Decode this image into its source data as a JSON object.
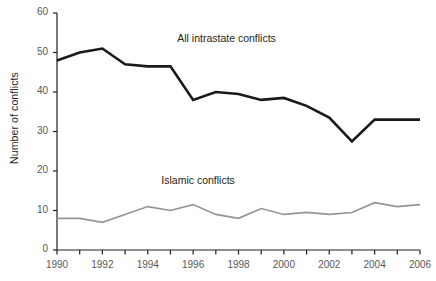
{
  "chart_data": {
    "type": "line",
    "title": "",
    "xlabel": "",
    "ylabel": "Number of conflicts",
    "xlim": [
      1990,
      2006
    ],
    "ylim": [
      0,
      60
    ],
    "grid": false,
    "legend_position": "inline-annotations",
    "x": [
      1990,
      1991,
      1992,
      1993,
      1994,
      1995,
      1996,
      1997,
      1998,
      1999,
      2000,
      2001,
      2002,
      2003,
      2004,
      2005,
      2006
    ],
    "xtick_labels": [
      "1990",
      "1992",
      "1994",
      "1996",
      "1998",
      "2000",
      "2002",
      "2004",
      "2006"
    ],
    "xtick_values": [
      1990,
      1992,
      1994,
      1996,
      1998,
      2000,
      2002,
      2004,
      2006
    ],
    "ytick_labels": [
      "0",
      "10",
      "20",
      "30",
      "40",
      "50",
      "60"
    ],
    "ytick_values": [
      0,
      10,
      20,
      30,
      40,
      50,
      60
    ],
    "series": [
      {
        "name": "All intrastate conflicts",
        "color": "#1a1a1a",
        "width": 2.6,
        "label_x": 1995.3,
        "label_y": 53.5,
        "values": [
          48,
          50,
          51,
          47,
          46.5,
          46.5,
          38,
          40,
          39.5,
          38,
          38.5,
          36.5,
          33.5,
          27.5,
          33,
          33,
          33
        ]
      },
      {
        "name": "Islamic conflicts",
        "color": "#939598",
        "width": 1.7,
        "label_x": 1994.6,
        "label_y": 17.5,
        "values": [
          8,
          8,
          7,
          9,
          11,
          10,
          11.5,
          9,
          8,
          10.5,
          9,
          9.5,
          9,
          9.5,
          12,
          11,
          11.5
        ]
      }
    ],
    "axis_color": "#231f20"
  }
}
